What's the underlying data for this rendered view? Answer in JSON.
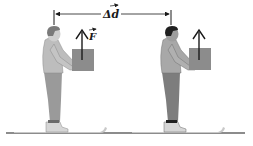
{
  "diagram": {
    "displacement_label": "Δd",
    "force_label": "F",
    "colors": {
      "line": "#1a1a1a",
      "box": "#8c8c8c",
      "shirt_left": "#bdbdbd",
      "pants_left": "#9a9a9a",
      "hair_left": "#7a7a7a",
      "shirt_right": "#a8a8a8",
      "pants_right": "#7d7d7d",
      "hair_right": "#202020",
      "skin": "#cfcfcf",
      "ski": "#c8c8c8",
      "shoe": "#d6d6d6"
    },
    "figures": [
      {
        "name": "person-before",
        "x": 40
      },
      {
        "name": "person-after",
        "x": 158
      }
    ]
  }
}
